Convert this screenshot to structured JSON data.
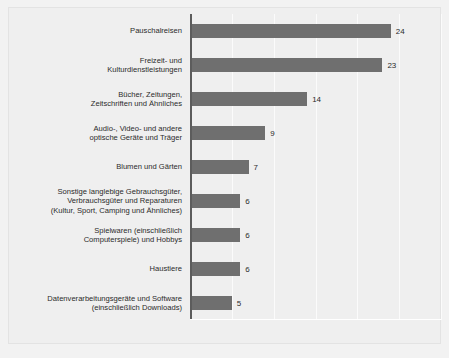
{
  "chart_data": {
    "type": "bar",
    "orientation": "horizontal",
    "title": "",
    "subtitle": "",
    "xlabel": "",
    "ylabel": "",
    "xlim": [
      0,
      30
    ],
    "grid": true,
    "gridlines": [
      5,
      10,
      15,
      20,
      25,
      30
    ],
    "legend": "none",
    "categories": [
      "Pauschalreisen",
      "Freizeit- und\nKulturdienstleistungen",
      "Bücher, Zeitungen,\nZeitschriften und Ähnliches",
      "Audio-, Video- und andere\noptische Geräte und Träger",
      "Blumen und Gärten",
      "Sonstige langlebige Gebrauchsgüter,\nVerbrauchsgüter und Reparaturen\n(Kultur, Sport, Camping und Ähnliches)",
      "Spielwaren (einschließlich\nComputerspiele) und Hobbys",
      "Haustiere",
      "Datenverarbeitungsgeräte und Software\n(einschließlich Downloads)"
    ],
    "values": [
      24,
      23,
      14,
      9,
      7,
      6,
      6,
      6,
      5
    ],
    "value_labels": [
      "24",
      "23",
      "14",
      "9",
      "7",
      "6",
      "6",
      "6",
      "5"
    ],
    "colors": {
      "bar": "#6f6f6f",
      "background": "#efefef",
      "page_background": "#f2f2f2",
      "axis": "#5c5c5c",
      "gridline": "#fbfbfb",
      "text": "#2b2b2b"
    }
  }
}
